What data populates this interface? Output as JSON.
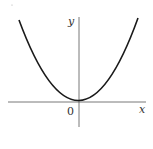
{
  "diagram": {
    "type": "function-graph",
    "labels": {
      "x_axis": "x",
      "y_axis": "y",
      "origin": "0"
    },
    "colors": {
      "curve": "#1a1a1a",
      "axes": "#555555",
      "text": "#333333"
    }
  }
}
